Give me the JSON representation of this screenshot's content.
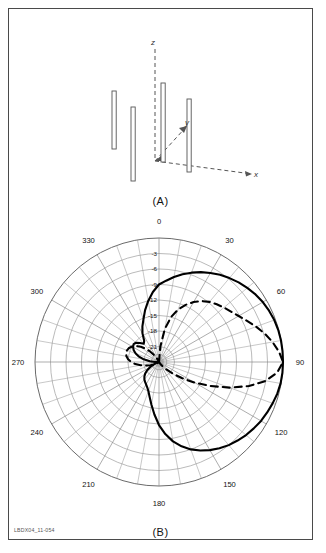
{
  "figure": {
    "id_code": "LBDX04_11-054",
    "panel_a_caption": "(A)",
    "panel_b_caption": "(B)"
  },
  "panel_a": {
    "title": "Four-element vertical dipole array geometry",
    "axes": [
      {
        "name": "z-axis",
        "label": "z"
      },
      {
        "name": "y-axis",
        "label": "y"
      },
      {
        "name": "x-axis",
        "label": "x"
      }
    ],
    "elements": [
      {
        "name": "dipole-1",
        "x1": 112,
        "y1": 88,
        "x2": 116,
        "y2": 140
      },
      {
        "name": "dipole-2",
        "x1": 131,
        "y1": 103,
        "x2": 135,
        "y2": 171
      },
      {
        "name": "dipole-3",
        "x1": 162,
        "y1": 83,
        "x2": 165,
        "y2": 148
      },
      {
        "name": "dipole-4",
        "x1": 188,
        "y1": 97,
        "x2": 191,
        "y2": 152
      }
    ]
  },
  "chart_data": {
    "type": "line",
    "subtype": "polar",
    "angle_unit": "degrees",
    "angle_tick_labels": [
      "0",
      "30",
      "60",
      "90",
      "120",
      "150",
      "180",
      "210",
      "240",
      "270",
      "300",
      "330"
    ],
    "angle_ticks": [
      0,
      30,
      60,
      90,
      120,
      150,
      180,
      210,
      240,
      270,
      300,
      330
    ],
    "angle_minor_step": 10,
    "radial_tick_labels": [
      "-3",
      "-6",
      "-9",
      "-12",
      "-15",
      "-18",
      "-21"
    ],
    "radial_ticks": [
      -3,
      -6,
      -9,
      -12,
      -15,
      -18,
      -21
    ],
    "radial_unit": "dB",
    "rlim": [
      -24,
      0
    ],
    "grid": true,
    "legend_position": "none",
    "series": [
      {
        "name": "solid-pattern",
        "style": "solid",
        "color": "#000000",
        "points": [
          [
            0,
            -9.0
          ],
          [
            5,
            -8.2
          ],
          [
            10,
            -7.3
          ],
          [
            15,
            -6.4
          ],
          [
            20,
            -5.6
          ],
          [
            25,
            -4.8
          ],
          [
            30,
            -4.1
          ],
          [
            35,
            -3.4
          ],
          [
            40,
            -2.8
          ],
          [
            45,
            -2.2
          ],
          [
            50,
            -1.7
          ],
          [
            55,
            -1.2
          ],
          [
            60,
            -0.8
          ],
          [
            65,
            -0.5
          ],
          [
            70,
            -0.25
          ],
          [
            75,
            -0.1
          ],
          [
            80,
            -0.02
          ],
          [
            85,
            0.0
          ],
          [
            90,
            0.0
          ],
          [
            95,
            -0.02
          ],
          [
            100,
            -0.1
          ],
          [
            105,
            -0.3
          ],
          [
            110,
            -0.6
          ],
          [
            115,
            -0.9
          ],
          [
            120,
            -1.2
          ],
          [
            125,
            -1.6
          ],
          [
            130,
            -2.0
          ],
          [
            135,
            -2.5
          ],
          [
            140,
            -3.0
          ],
          [
            145,
            -3.6
          ],
          [
            150,
            -4.3
          ],
          [
            155,
            -5.1
          ],
          [
            160,
            -6.0
          ],
          [
            165,
            -7.1
          ],
          [
            170,
            -8.4
          ],
          [
            175,
            -10.0
          ],
          [
            180,
            -11.8
          ],
          [
            185,
            -13.8
          ],
          [
            190,
            -15.6
          ],
          [
            195,
            -17.0
          ],
          [
            200,
            -18.0
          ],
          [
            205,
            -18.6
          ],
          [
            210,
            -19.0
          ],
          [
            215,
            -19.3
          ],
          [
            220,
            -19.6
          ],
          [
            225,
            -20.0
          ],
          [
            230,
            -20.5
          ],
          [
            235,
            -21.2
          ],
          [
            240,
            -22.0
          ],
          [
            245,
            -22.8
          ],
          [
            250,
            -23.4
          ],
          [
            255,
            -23.8
          ],
          [
            260,
            -24.0
          ],
          [
            265,
            -23.8
          ],
          [
            270,
            -23.2
          ],
          [
            275,
            -22.2
          ],
          [
            280,
            -21.0
          ],
          [
            285,
            -20.0
          ],
          [
            290,
            -19.2
          ],
          [
            295,
            -18.6
          ],
          [
            300,
            -18.2
          ],
          [
            305,
            -18.0
          ],
          [
            310,
            -18.2
          ],
          [
            315,
            -18.8
          ],
          [
            320,
            -19.4
          ],
          [
            325,
            -19.0
          ],
          [
            330,
            -17.6
          ],
          [
            335,
            -16.4
          ],
          [
            340,
            -15.2
          ],
          [
            345,
            -13.6
          ],
          [
            350,
            -12.0
          ],
          [
            355,
            -10.4
          ],
          [
            360,
            -9.0
          ]
        ]
      },
      {
        "name": "dashed-pattern",
        "style": "dashed",
        "color": "#000000",
        "points": [
          [
            0,
            -24.0
          ],
          [
            5,
            -21.0
          ],
          [
            10,
            -17.5
          ],
          [
            15,
            -15.0
          ],
          [
            20,
            -13.2
          ],
          [
            25,
            -11.8
          ],
          [
            30,
            -10.6
          ],
          [
            35,
            -9.6
          ],
          [
            40,
            -8.8
          ],
          [
            45,
            -8.2
          ],
          [
            50,
            -7.6
          ],
          [
            55,
            -7.0
          ],
          [
            60,
            -6.2
          ],
          [
            65,
            -5.2
          ],
          [
            70,
            -4.0
          ],
          [
            75,
            -2.8
          ],
          [
            80,
            -1.7
          ],
          [
            85,
            -0.7
          ],
          [
            90,
            0.0
          ],
          [
            95,
            -1.0
          ],
          [
            100,
            -3.0
          ],
          [
            105,
            -6.0
          ],
          [
            110,
            -9.5
          ],
          [
            115,
            -13.0
          ],
          [
            120,
            -16.0
          ],
          [
            125,
            -18.5
          ],
          [
            130,
            -20.5
          ],
          [
            135,
            -22.0
          ],
          [
            140,
            -23.0
          ],
          [
            145,
            -23.6
          ],
          [
            150,
            -24.0
          ],
          [
            160,
            -24.0
          ],
          [
            170,
            -24.0
          ],
          [
            180,
            -24.0
          ],
          [
            190,
            -24.0
          ],
          [
            200,
            -24.0
          ],
          [
            210,
            -24.0
          ],
          [
            220,
            -24.0
          ],
          [
            230,
            -23.6
          ],
          [
            240,
            -23.0
          ],
          [
            250,
            -22.2
          ],
          [
            255,
            -21.4
          ],
          [
            260,
            -20.4
          ],
          [
            265,
            -19.4
          ],
          [
            270,
            -18.6
          ],
          [
            275,
            -18.0
          ],
          [
            280,
            -17.6
          ],
          [
            285,
            -17.4
          ],
          [
            290,
            -17.4
          ],
          [
            295,
            -17.6
          ],
          [
            300,
            -18.0
          ],
          [
            305,
            -18.6
          ],
          [
            310,
            -19.4
          ],
          [
            315,
            -20.4
          ],
          [
            320,
            -21.4
          ],
          [
            325,
            -22.4
          ],
          [
            330,
            -23.2
          ],
          [
            335,
            -23.8
          ],
          [
            340,
            -24.0
          ],
          [
            350,
            -24.0
          ],
          [
            360,
            -24.0
          ]
        ]
      }
    ]
  }
}
